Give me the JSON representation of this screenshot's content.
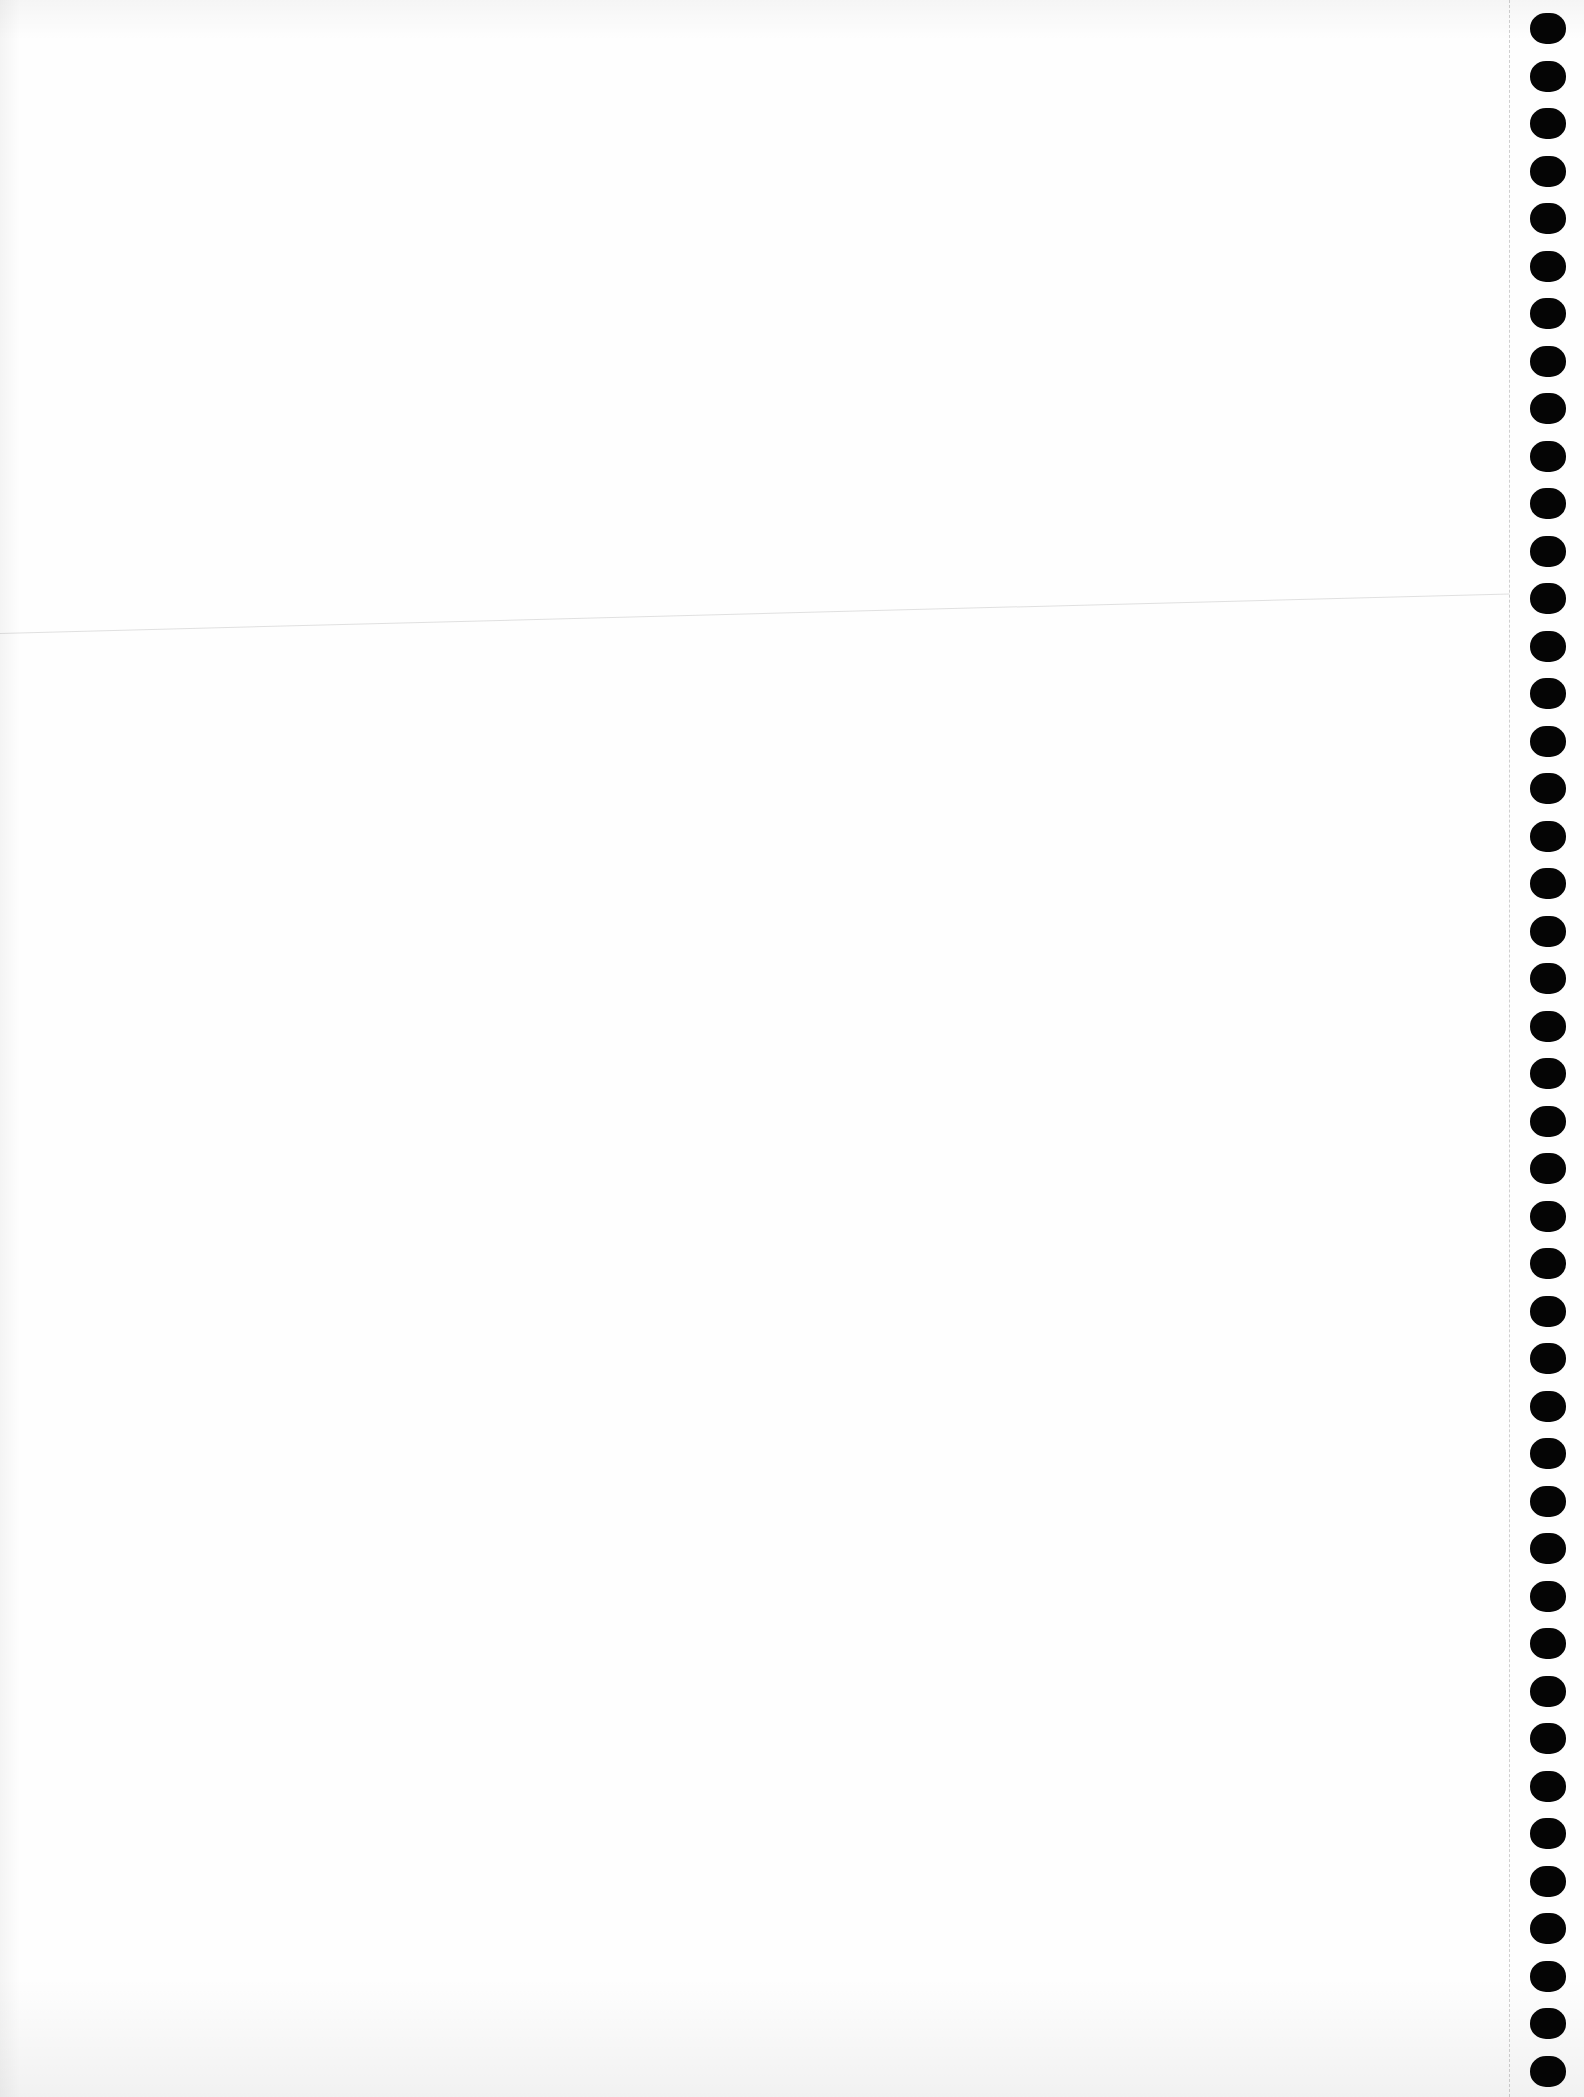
{
  "document": {
    "type": "continuous-form paper (scanned, blank)",
    "paper_color": "#fefefe",
    "hole_color": "#050505",
    "feed_holes": {
      "side": "right",
      "count": 44
    },
    "perforation_line": true,
    "crease_line": true,
    "bleed_through_text": {
      "line_1": "",
      "line_2": ""
    }
  }
}
